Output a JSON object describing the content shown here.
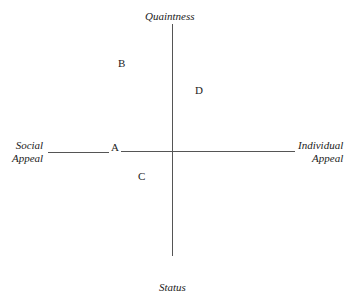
{
  "axes": {
    "top": "Quaintness",
    "bottom": "Status",
    "left": [
      "Social",
      "Appeal"
    ],
    "right": [
      "Individual",
      "Appeal"
    ]
  },
  "points": [
    {
      "label": "A"
    },
    {
      "label": "B"
    },
    {
      "label": "C"
    },
    {
      "label": "D"
    }
  ],
  "colors": {
    "line": "#555555",
    "text": "#222222"
  }
}
